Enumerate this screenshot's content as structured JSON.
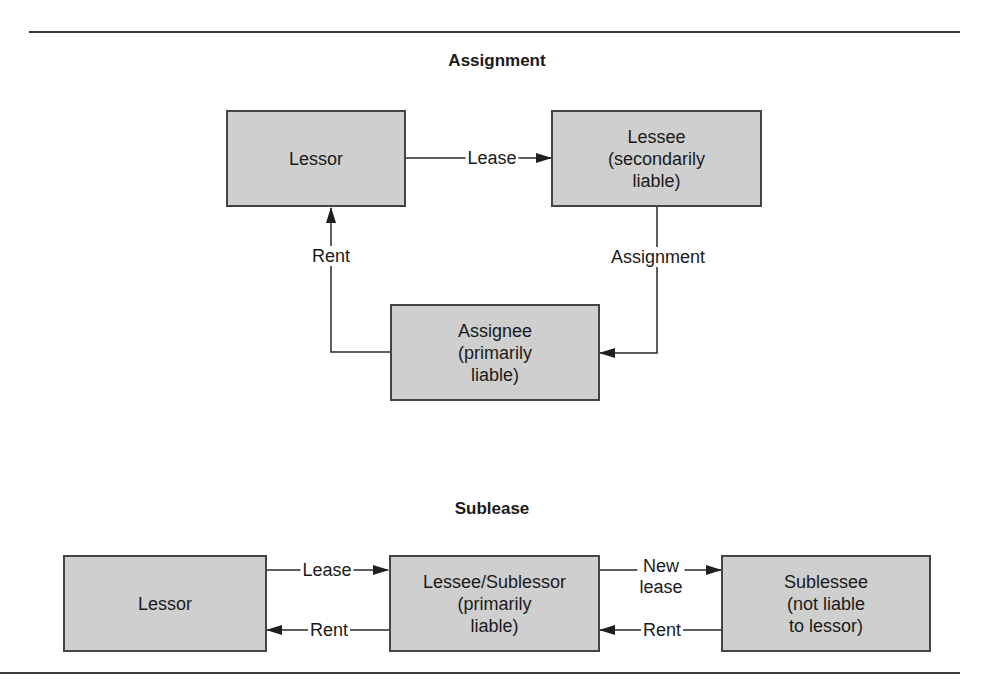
{
  "assignment": {
    "title": "Assignment",
    "boxes": {
      "lessor": {
        "lines": [
          "Lessor"
        ]
      },
      "lessee": {
        "lines": [
          "Lessee",
          "(secondarily",
          "liable)"
        ]
      },
      "assignee": {
        "lines": [
          "Assignee",
          "(primarily",
          "liable)"
        ]
      }
    },
    "edges": {
      "lease": "Lease",
      "assignment": "Assignment",
      "rent": "Rent"
    }
  },
  "sublease": {
    "title": "Sublease",
    "boxes": {
      "lessor": {
        "lines": [
          "Lessor"
        ]
      },
      "sublessor": {
        "lines": [
          "Lessee/Sublessor",
          "(primarily",
          "liable)"
        ]
      },
      "sublessee": {
        "lines": [
          "Sublessee",
          "(not liable",
          "to lessor)"
        ]
      }
    },
    "edges": {
      "lease": "Lease",
      "rent_to_lessor": "Rent",
      "new_lease": [
        "New",
        "lease"
      ],
      "rent_to_sublessor": "Rent"
    }
  },
  "colors": {
    "box_fill": "#cfcfcf",
    "box_border": "#444444",
    "line": "#2a2a2a",
    "text": "#1a1a1a"
  }
}
